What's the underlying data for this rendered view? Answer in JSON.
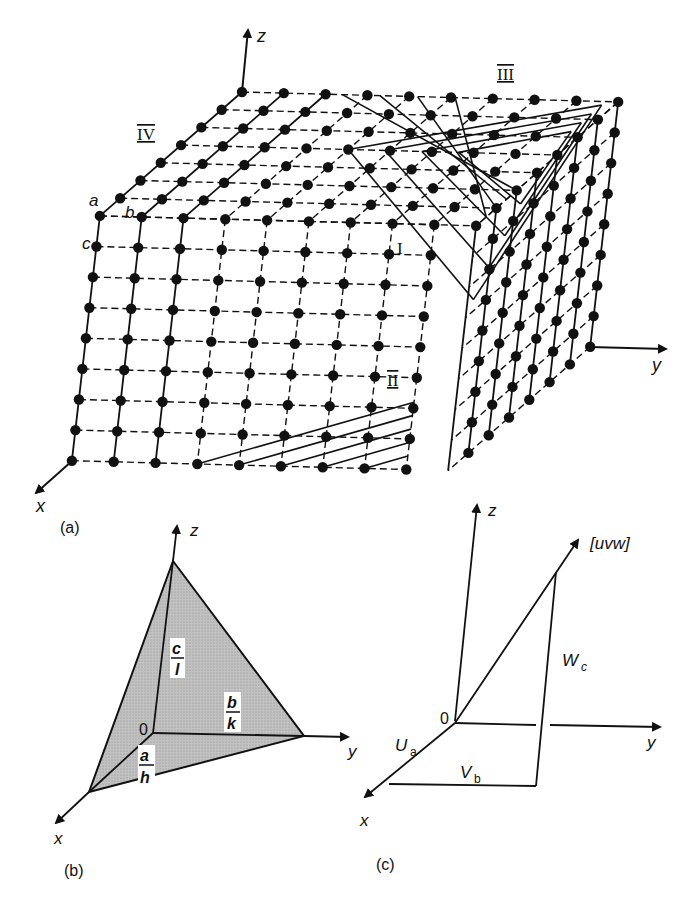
{
  "figure": {
    "background": "#ffffff",
    "ink": "#111111",
    "shade": "#b8b8b8"
  },
  "panel_a": {
    "caption": "(a)",
    "axes": {
      "x": "x",
      "y": "y",
      "z": "z"
    },
    "lattice_params": {
      "a": "a",
      "b": "b",
      "c": "c"
    },
    "plane_labels": {
      "I": "I",
      "II": "II",
      "III": "III",
      "IV": "IV"
    },
    "lattice": {
      "nodes_x": 8,
      "nodes_y": 10,
      "nodes_z": 9,
      "origin": [
        242,
        92
      ],
      "vec_x": [
        -20.3,
        17.7
      ],
      "vec_y": [
        41.8,
        1.1
      ],
      "vec_z": [
        -3.5,
        30.6
      ]
    }
  },
  "panel_b": {
    "caption": "(b)",
    "axes": {
      "x": "x",
      "y": "y",
      "z": "z"
    },
    "origin_label": "0",
    "intercepts": [
      {
        "num": "a",
        "den": "h"
      },
      {
        "num": "b",
        "den": "k"
      },
      {
        "num": "c",
        "den": "l"
      }
    ]
  },
  "panel_c": {
    "caption": "(c)",
    "axes": {
      "x": "x",
      "y": "y",
      "z": "z"
    },
    "origin_label": "0",
    "direction_label": "[uvw]",
    "components": [
      {
        "main": "U",
        "sub": "a"
      },
      {
        "main": "V",
        "sub": "b"
      },
      {
        "main": "W",
        "sub": "c"
      }
    ]
  }
}
